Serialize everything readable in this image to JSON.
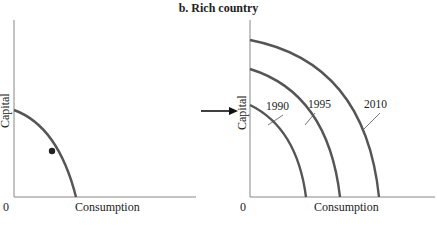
{
  "title": "b. Rich country",
  "left_panel": {
    "x_label": "Consumption",
    "y_label": "Capital",
    "origin": "0",
    "has_point": true
  },
  "right_panel": {
    "x_label": "Consumption",
    "y_label": "Capital",
    "origin": "0",
    "curves": [
      {
        "label": "1990"
      },
      {
        "label": "1995"
      },
      {
        "label": "2010"
      }
    ]
  },
  "colors": {
    "curve": "#555555",
    "axis": "#888888",
    "text": "#222222"
  }
}
